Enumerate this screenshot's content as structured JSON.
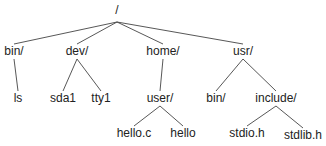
{
  "diagram": {
    "type": "directory-tree",
    "colors": {
      "line": "#444444",
      "text": "#222222",
      "background": "#ffffff"
    },
    "nodes": [
      {
        "id": "root",
        "label": "/",
        "x": 117,
        "y": 14,
        "anchor_y": 22
      },
      {
        "id": "bin",
        "label": "bin/",
        "x": 14,
        "y": 55,
        "parent": "root"
      },
      {
        "id": "dev",
        "label": "dev/",
        "x": 77,
        "y": 55,
        "parent": "root"
      },
      {
        "id": "home",
        "label": "home/",
        "x": 163,
        "y": 55,
        "parent": "root"
      },
      {
        "id": "usr",
        "label": "usr/",
        "x": 243,
        "y": 55,
        "parent": "root"
      },
      {
        "id": "ls",
        "label": "ls",
        "x": 18,
        "y": 102,
        "parent": "bin"
      },
      {
        "id": "sda1",
        "label": "sda1",
        "x": 63,
        "y": 102,
        "parent": "dev"
      },
      {
        "id": "tty1",
        "label": "tty1",
        "x": 101,
        "y": 102,
        "parent": "dev"
      },
      {
        "id": "user",
        "label": "user/",
        "x": 160,
        "y": 102,
        "parent": "home"
      },
      {
        "id": "usrbin",
        "label": "bin/",
        "x": 216,
        "y": 102,
        "parent": "usr"
      },
      {
        "id": "include",
        "label": "include/",
        "x": 276,
        "y": 102,
        "parent": "usr"
      },
      {
        "id": "helloc",
        "label": "hello.c",
        "x": 134,
        "y": 137,
        "parent": "user"
      },
      {
        "id": "hello",
        "label": "hello",
        "x": 183,
        "y": 137,
        "parent": "user"
      },
      {
        "id": "stdioh",
        "label": "stdio.h",
        "x": 247,
        "y": 137,
        "parent": "include"
      },
      {
        "id": "stdlibh",
        "label": "stdlib.h",
        "x": 303,
        "y": 139,
        "parent": "include"
      }
    ]
  }
}
